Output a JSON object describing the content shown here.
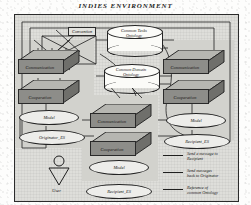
{
  "title": "INDIES  ENVIRONMENT",
  "labels": {
    "convention": "Convention",
    "user": "User"
  },
  "ontologies": [
    {
      "name": "common-tasks-ontology",
      "line1": "Common Tasks",
      "line2": "Ontology"
    },
    {
      "name": "common-domain-ontology",
      "line1": "Common Domain",
      "line2": "Ontology"
    }
  ],
  "agents": [
    {
      "id": "originator-agent",
      "boxes": [
        {
          "name": "communication",
          "label": "Communication"
        },
        {
          "name": "cooperation",
          "label": "Cooperation"
        }
      ],
      "ellipses": [
        {
          "name": "model",
          "label": "Model"
        },
        {
          "name": "expert-system",
          "label": "Originator_ES"
        }
      ]
    },
    {
      "id": "center-agent",
      "boxes": [
        {
          "name": "communication",
          "label": "Communication"
        },
        {
          "name": "cooperation",
          "label": "Cooperation"
        }
      ],
      "ellipses": [
        {
          "name": "model",
          "label": "Model"
        },
        {
          "name": "expert-system",
          "label": "Recipient_ES"
        }
      ]
    },
    {
      "id": "recipient-agent",
      "boxes": [
        {
          "name": "communication",
          "label": "Communication"
        },
        {
          "name": "cooperation",
          "label": "Cooperation"
        }
      ],
      "ellipses": [
        {
          "name": "model",
          "label": "Model"
        },
        {
          "name": "expert-system",
          "label": "Recipient_ES"
        }
      ]
    }
  ],
  "legend": [
    {
      "name": "send-message-to-recipient",
      "line1": "Send a message to",
      "line2": "Recipient"
    },
    {
      "name": "send-messages-back-to-originator",
      "line1": "Send messages",
      "line2": "back to Originator"
    },
    {
      "name": "reference-of-common-ontology",
      "line1": "Reference of",
      "line2": "common Ontology"
    }
  ],
  "colors": {
    "frame_bg": "#dededa",
    "box_face": "#8d8d89",
    "ink": "#1e1e1e",
    "cylinder": "#fbfbf8"
  }
}
